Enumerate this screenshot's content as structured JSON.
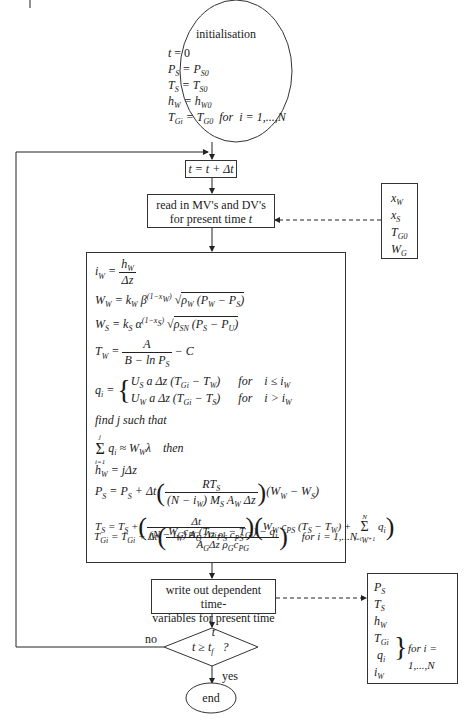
{
  "initialisation": {
    "title": "initialisation",
    "lines": [
      "t = 0",
      "P_S = P_S0",
      "T_S = T_S0",
      "h_W = h_W0",
      "T_Gi = T_G0  for  i = 1,...,N"
    ]
  },
  "time_step": {
    "label": "t = t + Δt"
  },
  "read_inputs": {
    "line1": "read in MV's and DV's",
    "line2": "for present time",
    "var": "t"
  },
  "input_variables": [
    "x_W",
    "x_S",
    "T_G0",
    "W_G"
  ],
  "model_equations": [
    "i_W = h_W / Δz",
    "W_W = k_W β^(1−x_W) √(ρ_W (P_W − P_S))",
    "W_S = k_S α^(1−x_S) √(ρ_SN (P_S − P_U))",
    "T_W = A / (B − ln P_S) − C",
    "q_i = U_S a Δz (T_Gi − T_W) for i ≤ i_W ; U_W a Δz (T_Gi − T_S) for i > i_W",
    "find j such that",
    "Σ_{i=1}^{j} q_i ≈ W_W λ then",
    "h_W = jΔz",
    "P_S = P_S + Δt (R T_S / ((N − i_W) M_S A_W Δz)) (W_W − W_S)",
    "T_S = T_S + (Δt / ((N − i_W) A_G Δz ρ_S c_PS)) (W_W c_PS (T_S − T_W) + Σ_{i=i_W+1}^{N} q_i)",
    "T_Gi = T_Gi + Δt ((W_G c_PG (T_Gi+1 − T_Gi) − q_i) / (A_G Δz ρ_G c_PG)) for i = 1,...N"
  ],
  "labels": {
    "find_j": "find  j  such that",
    "then": "then",
    "for": "for",
    "for_i_N": "for  i = 1,...N",
    "for_i_N2": "for i = 1,...,N"
  },
  "write_outputs": {
    "line1": "write out dependent time-",
    "line2": "variables for present time",
    "var": "t"
  },
  "output_variables": [
    "P_S",
    "T_S",
    "h_W",
    "T_Gi",
    "q_i",
    "i_W"
  ],
  "decision": {
    "condition": "t ≥ t_f  ?",
    "no_label": "no",
    "yes_label": "yes"
  },
  "end": {
    "label": "end"
  }
}
